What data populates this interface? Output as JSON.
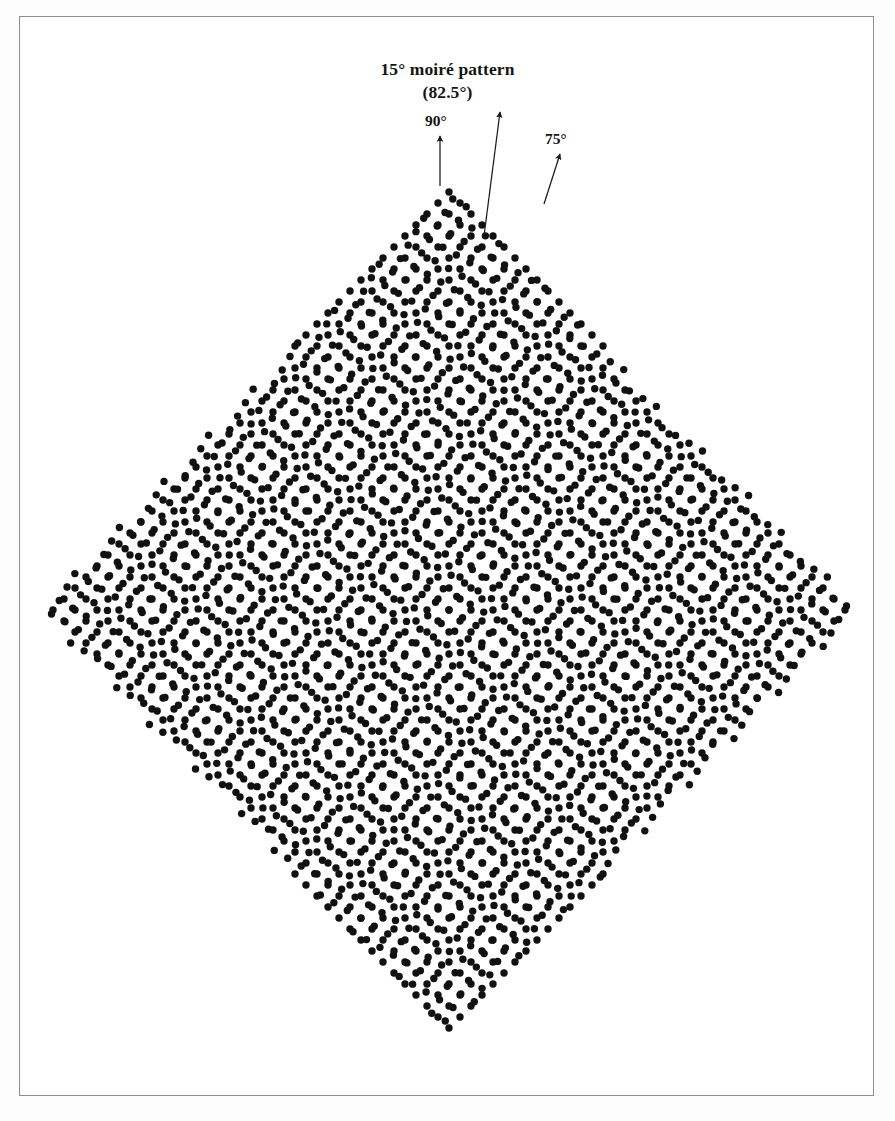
{
  "figure": {
    "title_line1": "15° moiré pattern",
    "title_line2": "(82.5°)",
    "labels": {
      "grid_a": "90°",
      "grid_b": "75°"
    },
    "annotations": [
      {
        "name": "arrow-90",
        "label": "90°",
        "angle_deg": 90,
        "tail": [
          440,
          186
        ],
        "tip": [
          440,
          136
        ]
      },
      {
        "name": "arrow-82_5",
        "label": "82.5°",
        "angle_deg": 82.5,
        "tail": [
          484,
          236
        ],
        "tip": [
          500,
          112
        ]
      },
      {
        "name": "arrow-75",
        "label": "75°",
        "angle_deg": 75,
        "tail": [
          544,
          204
        ],
        "tip": [
          560,
          154
        ]
      }
    ]
  },
  "chart_data": {
    "type": "scatter",
    "title": "15° moiré pattern (82.5°)",
    "xlabel": "",
    "ylabel": "",
    "grid": false,
    "legend_position": "none",
    "dot_color": "#111111",
    "background_color": "#ffffff",
    "dot_radius_px": 3.7,
    "lattice_period_px": 22,
    "rotation_offset_deg": 15,
    "moire_period_px": 84.4,
    "moire_angle_deg": 82.5,
    "center": [
      449,
      610
    ],
    "clip_shape": "diamond",
    "clip_half_width_px": 412,
    "clip_half_height_px": 422,
    "series": [
      {
        "name": "lattice 90°",
        "angle_deg": 90,
        "period_px": 22,
        "count_approx": 1100
      },
      {
        "name": "lattice 75°",
        "angle_deg": 75,
        "period_px": 22,
        "count_approx": 1100
      }
    ],
    "extent": {
      "x": [
        37,
        861
      ],
      "y": [
        188,
        1032
      ]
    }
  }
}
